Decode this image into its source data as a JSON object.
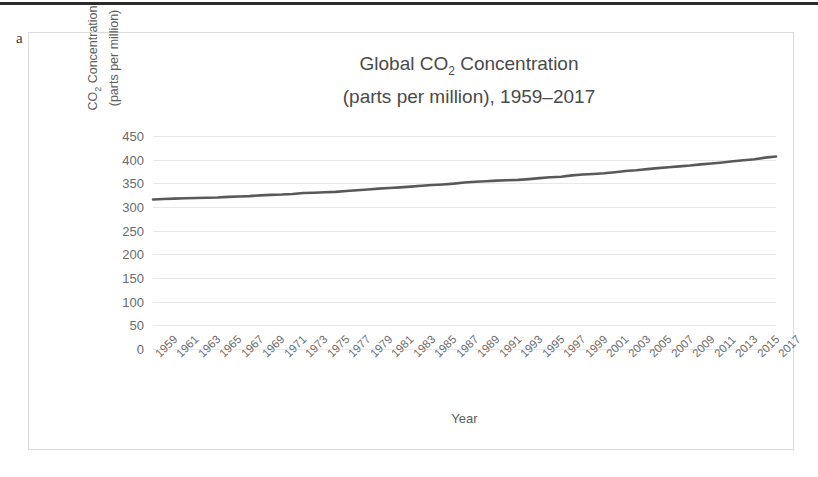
{
  "panel_label": "a",
  "chart_data": {
    "type": "line",
    "title_line1": "Global CO2 Concentration",
    "title_line2": "(parts per million), 1959–2017",
    "title_main": "Global CO",
    "title_sub": "2",
    "title_main_rest": " Concentration",
    "xlabel": "Year",
    "ylabel_line1_main": "CO",
    "ylabel_line1_sub": "2",
    "ylabel_line1_rest": " Concentration",
    "ylabel_line2": "(parts per million)",
    "ylim": [
      0,
      450
    ],
    "ytick_step": 50,
    "yticks": [
      0,
      50,
      100,
      150,
      200,
      250,
      300,
      350,
      400,
      450
    ],
    "grid": true,
    "legend": "none",
    "line_color": "#595959",
    "grid_color": "#e8e8e8",
    "xtick_labels": [
      "1959",
      "1961",
      "1963",
      "1965",
      "1967",
      "1969",
      "1971",
      "1973",
      "1975",
      "1977",
      "1979",
      "1981",
      "1983",
      "1985",
      "1987",
      "1989",
      "1991",
      "1993",
      "1995",
      "1997",
      "1999",
      "2001",
      "2003",
      "2005",
      "2007",
      "2009",
      "2011",
      "2013",
      "2015",
      "2017"
    ],
    "x": [
      1959,
      1960,
      1961,
      1962,
      1963,
      1964,
      1965,
      1966,
      1967,
      1968,
      1969,
      1970,
      1971,
      1972,
      1973,
      1974,
      1975,
      1976,
      1977,
      1978,
      1979,
      1980,
      1981,
      1982,
      1983,
      1984,
      1985,
      1986,
      1987,
      1988,
      1989,
      1990,
      1991,
      1992,
      1993,
      1994,
      1995,
      1996,
      1997,
      1998,
      1999,
      2000,
      2001,
      2002,
      2003,
      2004,
      2005,
      2006,
      2007,
      2008,
      2009,
      2010,
      2011,
      2012,
      2013,
      2014,
      2015,
      2016,
      2017
    ],
    "values": [
      315.98,
      316.91,
      317.64,
      318.45,
      318.99,
      319.62,
      320.04,
      321.37,
      322.18,
      323.05,
      324.62,
      325.68,
      326.32,
      327.46,
      329.68,
      330.19,
      331.12,
      332.03,
      333.84,
      335.41,
      336.84,
      338.76,
      340.12,
      341.48,
      343.15,
      344.85,
      346.35,
      347.61,
      349.31,
      351.69,
      353.2,
      354.45,
      355.7,
      356.54,
      357.21,
      358.96,
      360.97,
      362.74,
      363.88,
      366.84,
      368.54,
      369.71,
      371.32,
      373.45,
      375.98,
      377.7,
      379.98,
      382.09,
      384.02,
      385.83,
      387.64,
      390.1,
      391.85,
      394.06,
      396.74,
      398.81,
      400.83,
      404.24,
      406.55
    ],
    "x_range": [
      1959,
      2017
    ]
  }
}
